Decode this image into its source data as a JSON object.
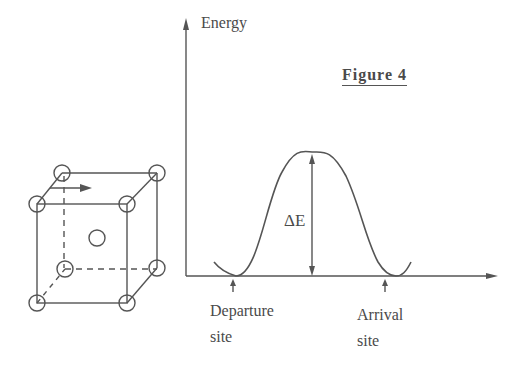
{
  "figure": {
    "title": "Figure 4",
    "y_axis_label": "Energy",
    "barrier_label": "ΔE",
    "departure_label_line1": "Departure",
    "departure_label_line2": "site",
    "arrival_label_line1": "Arrival",
    "arrival_label_line2": "site"
  },
  "cube": {
    "description": "Body-centered cubic unit cell with corner atoms and a central interstitial site; arrow indicates atom jump direction",
    "corner_atoms": 8,
    "center_atom": 1
  },
  "colors": {
    "ink": "#555555",
    "background": "#ffffff"
  }
}
